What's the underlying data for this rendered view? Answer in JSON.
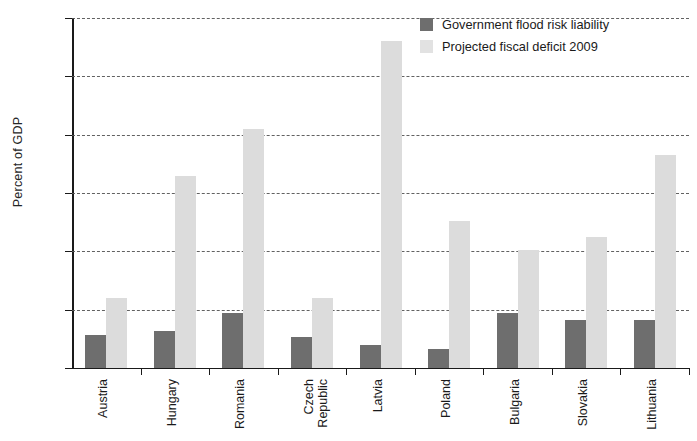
{
  "chart_data": {
    "type": "bar",
    "title": "",
    "xlabel": "",
    "ylabel": "Percent of GDP",
    "ylim": [
      0,
      6
    ],
    "ytick_values": [
      0,
      1,
      2,
      3,
      4,
      5,
      6
    ],
    "ytick_labels": [
      "0%",
      "1%",
      "2%",
      "3%",
      "4%",
      "5%",
      "6%"
    ],
    "grid": true,
    "grid_style": "dashed horizontal",
    "legend_position": "top-right",
    "categories": [
      "Austria",
      "Hungary",
      "Romania",
      "Czech\nRepublic",
      "Latvia",
      "Poland",
      "Bulgaria",
      "Slovakia",
      "Lithuania"
    ],
    "series": [
      {
        "name": "Government flood risk liability",
        "color": "#6e6e6e",
        "values": [
          0.57,
          0.63,
          0.94,
          0.54,
          0.4,
          0.33,
          0.95,
          0.82,
          0.82
        ]
      },
      {
        "name": "Projected fiscal deficit 2009",
        "color": "#dcdcdc",
        "values": [
          1.2,
          3.3,
          4.1,
          1.2,
          5.6,
          2.52,
          2.02,
          2.25,
          3.65
        ]
      }
    ]
  },
  "legend": {
    "items": [
      {
        "label": "Government flood risk liability",
        "swatch": "dark"
      },
      {
        "label": "Projected fiscal deficit 2009",
        "swatch": "light"
      }
    ]
  }
}
